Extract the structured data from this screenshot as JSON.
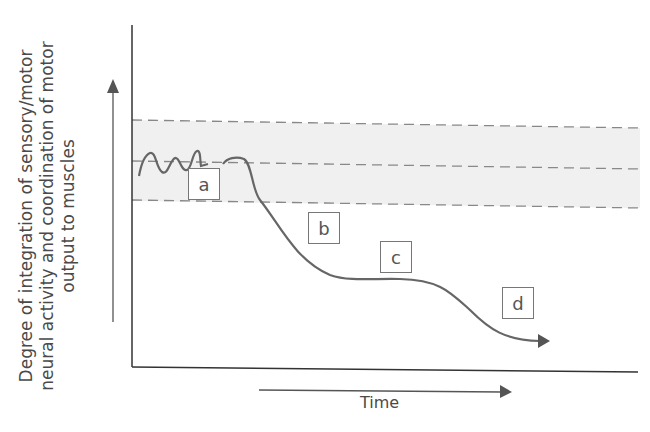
{
  "diagram": {
    "y_axis_label": "Degree of integration of sensory/motor neural activity and coordination of motor output to muscles",
    "x_axis_label": "Time",
    "normal_band": "shaded range bounded by dashed lines with central dashed line",
    "stage_labels": [
      {
        "id": "a",
        "label": "a"
      },
      {
        "id": "b",
        "label": "b"
      },
      {
        "id": "c",
        "label": "c"
      },
      {
        "id": "d",
        "label": "d"
      }
    ],
    "colors": {
      "curve": "#666666",
      "band": "#f0f0f0",
      "dash": "#888888",
      "axis": "#333333"
    }
  }
}
